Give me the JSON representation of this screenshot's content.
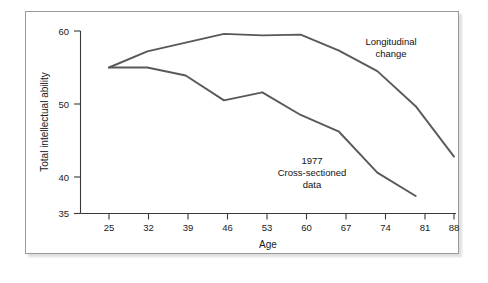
{
  "figure": {
    "background_color": "#ffffff",
    "border_color": "#9a9a9a",
    "line_color": "#595959",
    "text_color": "#111111"
  },
  "chart_data": {
    "type": "line",
    "title": "",
    "xlabel": "Age",
    "ylabel": "Total intellectual ability",
    "x": [
      25,
      32,
      39,
      46,
      53,
      60,
      67,
      74,
      81,
      88
    ],
    "xtick_labels": [
      "25",
      "32",
      "39",
      "46",
      "53",
      "60",
      "67",
      "74",
      "81",
      "88"
    ],
    "ytick_labels": [
      "35",
      "40",
      "50",
      "60"
    ],
    "ytick_values": [
      35,
      40,
      50,
      60
    ],
    "xlim": [
      25,
      88
    ],
    "ylim": [
      35,
      60
    ],
    "grid": false,
    "legend_position": "inline-annotations",
    "series": [
      {
        "name": "Longitudinal change",
        "x": [
          25,
          32,
          39,
          46,
          53,
          60,
          67,
          74,
          81,
          88
        ],
        "values": [
          55.0,
          57.2,
          58.4,
          59.6,
          59.4,
          59.5,
          57.3,
          54.5,
          49.7,
          42.8
        ]
      },
      {
        "name": "1977 Cross-sectioned data",
        "x": [
          25,
          32,
          39,
          46,
          53,
          60,
          67,
          74,
          81
        ],
        "values": [
          55.0,
          55.0,
          53.9,
          50.5,
          51.6,
          48.5,
          46.2,
          40.6,
          37.4
        ]
      }
    ],
    "annotations": [
      {
        "id": "longitudinal-annotation",
        "lines": [
          "Longitudinal",
          "change"
        ],
        "x_px": 390,
        "y_px": 40
      },
      {
        "id": "cross-sectioned-annotation",
        "lines": [
          "1977",
          "Cross-sectioned",
          "data"
        ],
        "x_px": 311,
        "y_px": 166
      }
    ]
  }
}
